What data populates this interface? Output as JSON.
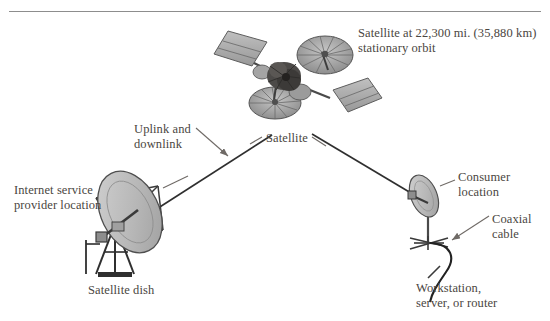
{
  "diagram": {
    "border_color": "#7a7a7a",
    "text_color": "#4a4641",
    "line_color": "#3a3a3a",
    "dish_fill": "#b9b9b9",
    "panel_fill": "#a8a8a8",
    "background": "#ffffff"
  },
  "labels": {
    "orbit": "Satellite at 22,300 mi. (35,880 km)\nstationary orbit",
    "uplink": "Uplink and\ndownlink",
    "satellite": "Satellite",
    "isp_location": "Internet service\nprovider location",
    "consumer_location": "Consumer\nlocation",
    "coaxial_cable": "Coaxial\ncable",
    "satellite_dish": "Satellite dish",
    "workstation": "Workstation,\nserver, or router"
  },
  "nodes": {
    "satellite": {
      "name": "satellite",
      "x": 283,
      "y": 75
    },
    "isp_dish": {
      "name": "isp-satellite-dish",
      "x": 125,
      "y": 225
    },
    "consumer_dish": {
      "name": "consumer-satellite-dish",
      "x": 428,
      "y": 205
    }
  },
  "links": [
    {
      "name": "isp-to-satellite-link",
      "from": "isp_dish",
      "to": "satellite"
    },
    {
      "name": "satellite-to-consumer-link",
      "from": "satellite",
      "to": "consumer_dish"
    }
  ]
}
